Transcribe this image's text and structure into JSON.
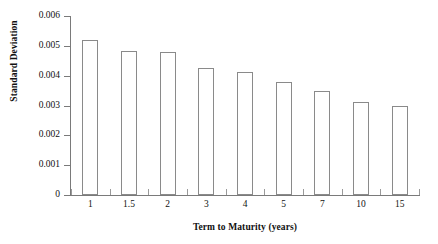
{
  "chart_data": {
    "type": "bar",
    "title": "",
    "xlabel": "Term to Maturity (years)",
    "ylabel": "Standard Deviation",
    "categories": [
      "1",
      "1.5",
      "2",
      "3",
      "4",
      "5",
      "7",
      "10",
      "15"
    ],
    "values": [
      0.0052,
      0.00483,
      0.00478,
      0.00427,
      0.00411,
      0.00379,
      0.00348,
      0.00312,
      0.00298
    ],
    "ylim": [
      0,
      0.006
    ],
    "yticks": [
      "0",
      "0.001",
      "0.002",
      "0.003",
      "0.004",
      "0.005",
      "0.006"
    ],
    "ytick_values": [
      0,
      0.001,
      0.002,
      0.003,
      0.004,
      0.005,
      0.006
    ],
    "grid": false,
    "legend": null,
    "bar_fill_color": "#ffffff",
    "bar_border_color": "#8a8a8a",
    "axis_color": "#7a7a7a",
    "text_color": "#111111"
  }
}
